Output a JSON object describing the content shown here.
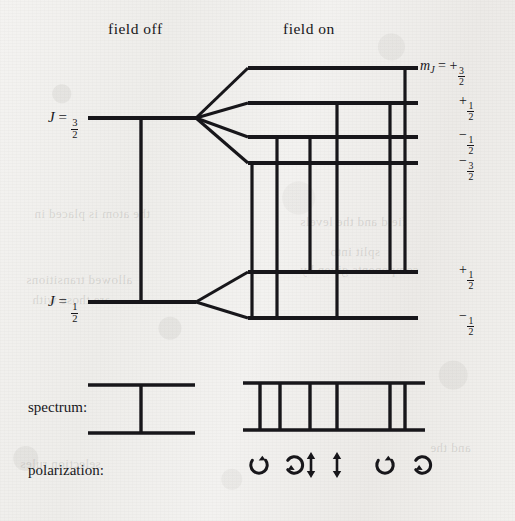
{
  "headers": {
    "field_off": "field off",
    "field_on": "field on"
  },
  "row_labels": {
    "spectrum": "spectrum:",
    "polarization": "polarization:"
  },
  "zero_field_levels": [
    {
      "id": "upper",
      "label_J": "J",
      "label_eq": "=",
      "num": "3",
      "den": "2",
      "y": 118
    },
    {
      "id": "lower",
      "label_J": "J",
      "label_eq": "=",
      "num": "1",
      "den": "2",
      "y": 302
    }
  ],
  "split_levels": {
    "upper": [
      {
        "mj_prefix": "m",
        "mj_sub": "J",
        "mj_eq": "=",
        "sign": "+",
        "num": "3",
        "den": "2",
        "y": 68,
        "full": "m_J = +3/2"
      },
      {
        "mj_prefix": "",
        "mj_sub": "",
        "mj_eq": "",
        "sign": "+",
        "num": "1",
        "den": "2",
        "y": 103,
        "full": "+1/2"
      },
      {
        "mj_prefix": "",
        "mj_sub": "",
        "mj_eq": "",
        "sign": "−",
        "num": "1",
        "den": "2",
        "y": 137,
        "full": "-1/2"
      },
      {
        "mj_prefix": "",
        "mj_sub": "",
        "mj_eq": "",
        "sign": "−",
        "num": "3",
        "den": "2",
        "y": 163,
        "full": "-3/2"
      }
    ],
    "lower": [
      {
        "sign": "+",
        "num": "1",
        "den": "2",
        "y": 272,
        "full": "+1/2"
      },
      {
        "sign": "−",
        "num": "1",
        "den": "2",
        "y": 318,
        "full": "-1/2"
      }
    ]
  },
  "transitions": [
    {
      "id": "t1",
      "x": 252,
      "from_level": "-3/2",
      "to_level": "-1/2",
      "polarization": "sigma"
    },
    {
      "id": "t2",
      "x": 277,
      "from_level": "-1/2",
      "to_level": "-1/2",
      "polarization": "sigma"
    },
    {
      "id": "t3",
      "x": 310,
      "from_level": "-1/2",
      "to_level": "+1/2",
      "polarization": "pi"
    },
    {
      "id": "t4",
      "x": 337,
      "from_level": "+1/2",
      "to_level": "-1/2",
      "polarization": "pi"
    },
    {
      "id": "t5",
      "x": 390,
      "from_level": "+1/2",
      "to_level": "+1/2",
      "polarization": "sigma"
    },
    {
      "id": "t6",
      "x": 405,
      "from_level": "+3/2",
      "to_level": "+1/2",
      "polarization": "sigma"
    }
  ],
  "spectrum": {
    "field_off": {
      "baseline_top": 385,
      "baseline_bottom": 433,
      "x_start": 88,
      "x_end": 195,
      "lines": [
        141
      ]
    },
    "field_on": {
      "baseline_top": 383,
      "baseline_bottom": 430,
      "x_start": 243,
      "x_end": 425,
      "lines": [
        260,
        280,
        310,
        337,
        390,
        405
      ]
    }
  },
  "polarization_symbols": [
    {
      "type": "sigma-ccw",
      "glyph": "circular-arrow",
      "x": 259,
      "name": "sigma-left-1"
    },
    {
      "type": "sigma-cw",
      "glyph": "circular-arrow",
      "x": 281,
      "name": "sigma-left-2"
    },
    {
      "type": "pi",
      "glyph": "double-arrow",
      "x": 311,
      "name": "pi-1"
    },
    {
      "type": "pi",
      "glyph": "double-arrow",
      "x": 337,
      "name": "pi-2"
    },
    {
      "type": "sigma-ccw",
      "glyph": "circular-arrow",
      "x": 385,
      "name": "sigma-right-1"
    },
    {
      "type": "sigma-cw",
      "glyph": "circular-arrow",
      "x": 409,
      "name": "sigma-right-2"
    }
  ],
  "bleed_text": [
    {
      "t": "the atom is placed in",
      "x": 34,
      "y": 206
    },
    {
      "t": "field and the levels",
      "x": 300,
      "y": 214
    },
    {
      "t": "split into",
      "x": 330,
      "y": 244
    },
    {
      "t": "components given by",
      "x": 300,
      "y": 262
    },
    {
      "t": "allowed transitions",
      "x": 26,
      "y": 272
    },
    {
      "t": "are those with",
      "x": 32,
      "y": 292
    },
    {
      "t": "selection rules",
      "x": 20,
      "y": 456
    },
    {
      "t": "and the",
      "x": 430,
      "y": 440
    }
  ],
  "colors": {
    "ink": "#17161a",
    "paper": "#f2f1ef",
    "bleed": "rgba(110,108,102,0.20)"
  }
}
